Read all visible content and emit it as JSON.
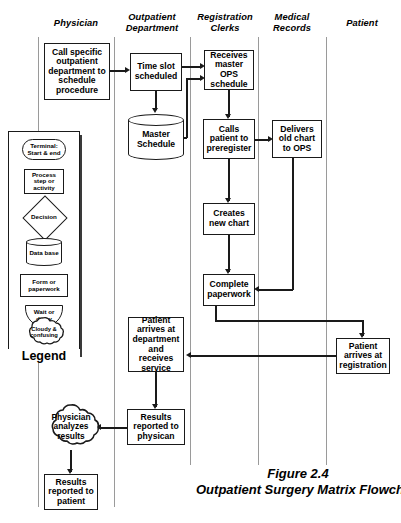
{
  "lanes": [
    {
      "id": "physician",
      "label": "Physician"
    },
    {
      "id": "outpatient-department",
      "label": "Outpatient\nDepartment"
    },
    {
      "id": "registration-clerks",
      "label": "Registration\nClerks"
    },
    {
      "id": "medical-records",
      "label": "Medical\nRecords"
    },
    {
      "id": "patient",
      "label": "Patient"
    }
  ],
  "lane_labels": {
    "physician": "Physician",
    "outpatient_l1": "Outpatient",
    "outpatient_l2": "Department",
    "registration_l1": "Registration",
    "registration_l2": "Clerks",
    "medical_l1": "Medical",
    "medical_l2": "Records",
    "patient": "Patient"
  },
  "nodes": {
    "call_specific": "Call specific outpatient department to schedule procedure",
    "time_slot": "Time slot scheduled",
    "master_schedule": "Master Schedule",
    "receives_master": "Receives master OPS schedule",
    "calls_patient": "Calls patient to preregister",
    "delivers_old_chart": "Delivers old chart to OPS",
    "creates_new_chart": "Creates new chart",
    "complete_paperwork": "Complete paperwork",
    "patient_arrives_registration": "Patient arrives at registration",
    "patient_arrives_department": "Patient arrives at department and receives service",
    "results_reported_physician": "Results reported to physican",
    "physician_analyzes": "Physician analyzes results",
    "results_reported_patient": "Results reported to patient"
  },
  "legend": {
    "title": "Legend",
    "items": [
      {
        "shape": "terminal",
        "label": "Terminal: Start & end"
      },
      {
        "shape": "process",
        "label": "Process step or activity"
      },
      {
        "shape": "decision",
        "label": "Decision"
      },
      {
        "shape": "database",
        "label": "Data base"
      },
      {
        "shape": "document",
        "label": "Form or paperwork"
      },
      {
        "shape": "delay",
        "label": "Wait or delay"
      },
      {
        "shape": "cloud",
        "label": "Cloudy & confusing"
      }
    ]
  },
  "caption": {
    "figure_number": "Figure 2.4",
    "figure_title": "Outpatient Surgery Matrix Flowchart"
  },
  "colors": {
    "ink": "#1a1a1a",
    "lane_divider": "#9a9a9a",
    "shadow": "#3a3a3a",
    "background": "#ffffff"
  }
}
